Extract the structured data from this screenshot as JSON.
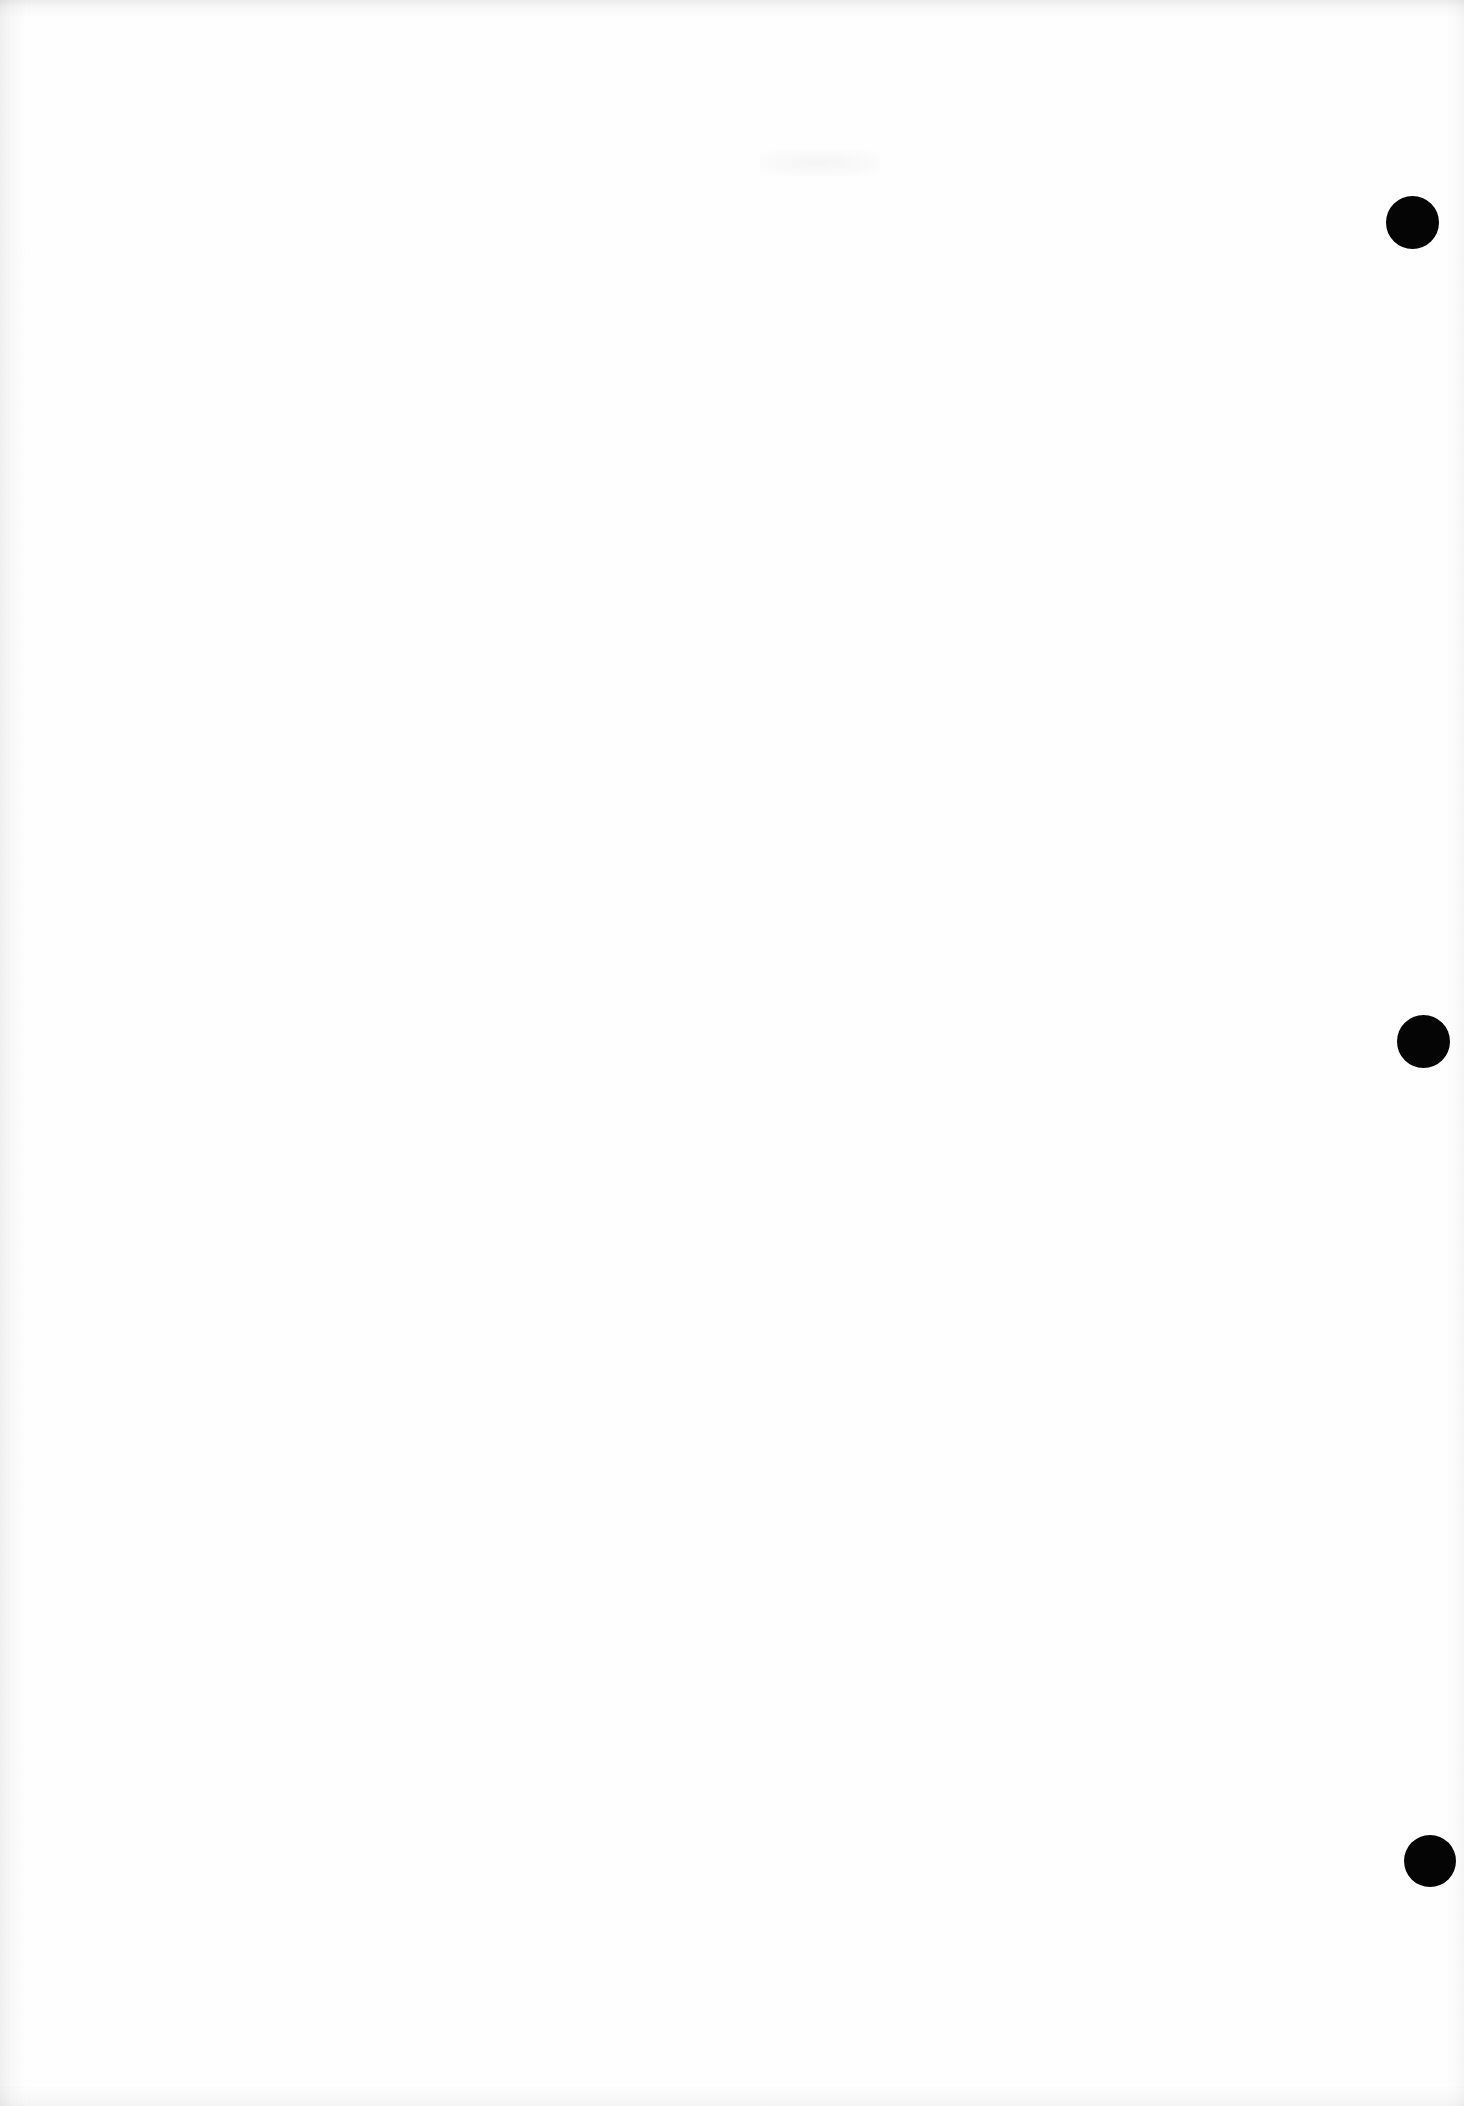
{
  "document": {
    "kind": "scanned-page",
    "page_state": "blank",
    "page_width": 1464,
    "page_height": 2106,
    "background_color": "#fefefe",
    "mark_color": "#050505",
    "visible_text": "",
    "body_text": ""
  },
  "marks": {
    "label": "registration-marks",
    "count": 3,
    "shape": "circle",
    "color": "#050505",
    "items": [
      {
        "name": "mark-dot-top",
        "center_x": 1412,
        "center_y": 222,
        "diameter": 53,
        "left": 1386,
        "top": 196
      },
      {
        "name": "mark-dot-middle",
        "center_x": 1423,
        "center_y": 1041,
        "diameter": 53,
        "left": 1397,
        "top": 1015
      },
      {
        "name": "mark-dot-bottom",
        "center_x": 1430,
        "center_y": 1861,
        "diameter": 52,
        "left": 1404,
        "top": 1835
      }
    ]
  },
  "artifacts": {
    "top_edge_shadow": "scan-edge-shadow-top",
    "left_edge_shadow": "scan-edge-shadow-left",
    "right_edge_shadow": "scan-edge-shadow-right",
    "bottom_edge_shadow": "scan-edge-shadow-bottom",
    "smudge": "faint-smudge-upper-right",
    "grain": "paper-grain-texture"
  }
}
